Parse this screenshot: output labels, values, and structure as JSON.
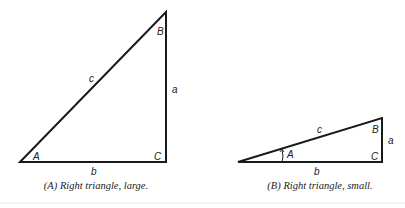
{
  "figures": [
    {
      "id": "A",
      "caption": "(A) Right triangle, large.",
      "vertices": {
        "A": "A",
        "B": "B",
        "C": "C"
      },
      "sides": {
        "a": "a",
        "b": "b",
        "c": "c"
      }
    },
    {
      "id": "B",
      "caption": "(B) Right triangle, small.",
      "vertices": {
        "A": "A",
        "B": "B",
        "C": "C"
      },
      "sides": {
        "a": "a",
        "b": "b",
        "c": "c"
      }
    }
  ],
  "colors": {
    "stroke": "#1a1a1a",
    "divider": "#e6e6e6"
  }
}
